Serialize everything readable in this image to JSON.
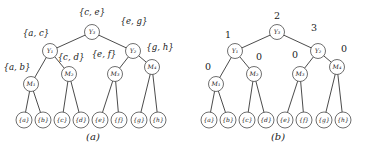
{
  "figure": {
    "panels": [
      {
        "id": "a",
        "caption": "(a)",
        "label_type": "sets",
        "nodes": [
          {
            "id": "Y3",
            "name": "Y₃",
            "x": 92,
            "y": 32,
            "r": 7.5,
            "label": "{c, e}",
            "label_x": 92,
            "label_y": 15,
            "label_anchor": "middle"
          },
          {
            "id": "Y1",
            "name": "Y₁",
            "x": 50,
            "y": 51,
            "r": 7.5,
            "label": "{a, c}",
            "label_x": 36,
            "label_y": 36,
            "label_anchor": "middle"
          },
          {
            "id": "Y2",
            "name": "Y₂",
            "x": 133,
            "y": 51,
            "r": 7.5,
            "label": "{e, g}",
            "label_x": 134,
            "label_y": 24,
            "label_anchor": "middle"
          },
          {
            "id": "M1",
            "name": "M₁",
            "x": 31,
            "y": 84,
            "r": 7.5,
            "label": "{a, b}",
            "label_x": 17,
            "label_y": 70,
            "label_anchor": "middle"
          },
          {
            "id": "M2",
            "name": "M₂",
            "x": 69,
            "y": 74,
            "r": 7.5,
            "label": "{c, d}",
            "label_x": 71,
            "label_y": 60,
            "label_anchor": "middle"
          },
          {
            "id": "M3",
            "name": "M₃",
            "x": 115,
            "y": 74,
            "r": 7.5,
            "label": "{e, f}",
            "label_x": 104,
            "label_y": 57,
            "label_anchor": "middle"
          },
          {
            "id": "M4",
            "name": "M₄",
            "x": 152,
            "y": 67,
            "r": 7.5,
            "label": "{g, h}",
            "label_x": 160,
            "label_y": 50,
            "label_anchor": "middle"
          }
        ],
        "leaves": [
          {
            "id": "a",
            "name": "{a}",
            "x": 24,
            "y": 120,
            "r": 8
          },
          {
            "id": "b",
            "name": "{b}",
            "x": 43,
            "y": 120,
            "r": 8
          },
          {
            "id": "c",
            "name": "{c}",
            "x": 62,
            "y": 120,
            "r": 8
          },
          {
            "id": "d",
            "name": "{d}",
            "x": 81,
            "y": 120,
            "r": 8
          },
          {
            "id": "e",
            "name": "{e}",
            "x": 100,
            "y": 120,
            "r": 8
          },
          {
            "id": "f",
            "name": "{f}",
            "x": 119,
            "y": 120,
            "r": 8
          },
          {
            "id": "g",
            "name": "{g}",
            "x": 139,
            "y": 120,
            "r": 8
          },
          {
            "id": "h",
            "name": "{h}",
            "x": 158,
            "y": 120,
            "r": 8
          }
        ],
        "edges": [
          {
            "from": "Y3",
            "to": "Y1"
          },
          {
            "from": "Y3",
            "to": "Y2"
          },
          {
            "from": "Y1",
            "to": "M1"
          },
          {
            "from": "Y1",
            "to": "M2"
          },
          {
            "from": "Y2",
            "to": "M3"
          },
          {
            "from": "Y2",
            "to": "M4"
          },
          {
            "from": "M1",
            "to": "a"
          },
          {
            "from": "M1",
            "to": "b"
          },
          {
            "from": "M2",
            "to": "c"
          },
          {
            "from": "M2",
            "to": "d"
          },
          {
            "from": "M3",
            "to": "e"
          },
          {
            "from": "M3",
            "to": "f"
          },
          {
            "from": "M4",
            "to": "g"
          },
          {
            "from": "M4",
            "to": "h"
          }
        ]
      },
      {
        "id": "b",
        "caption": "(b)",
        "label_type": "numbers",
        "nodes": [
          {
            "id": "Y3",
            "name": "Y₃",
            "x": 92,
            "y": 32,
            "r": 7.5,
            "label": "2",
            "label_x": 92,
            "label_y": 19,
            "label_anchor": "middle"
          },
          {
            "id": "Y1",
            "name": "Y₁",
            "x": 50,
            "y": 51,
            "r": 7.5,
            "label": "1",
            "label_x": 43,
            "label_y": 38,
            "label_anchor": "middle"
          },
          {
            "id": "Y2",
            "name": "Y₂",
            "x": 133,
            "y": 51,
            "r": 7.5,
            "label": "3",
            "label_x": 129,
            "label_y": 31,
            "label_anchor": "middle"
          },
          {
            "id": "M1",
            "name": "M₁",
            "x": 31,
            "y": 84,
            "r": 7.5,
            "label": "0",
            "label_x": 23,
            "label_y": 70,
            "label_anchor": "middle"
          },
          {
            "id": "M2",
            "name": "M₂",
            "x": 69,
            "y": 74,
            "r": 7.5,
            "label": "0",
            "label_x": 74,
            "label_y": 60,
            "label_anchor": "middle"
          },
          {
            "id": "M3",
            "name": "M₃",
            "x": 115,
            "y": 74,
            "r": 7.5,
            "label": "0",
            "label_x": 110,
            "label_y": 58,
            "label_anchor": "middle"
          },
          {
            "id": "M4",
            "name": "M₄",
            "x": 152,
            "y": 67,
            "r": 7.5,
            "label": "0",
            "label_x": 159,
            "label_y": 52,
            "label_anchor": "middle"
          }
        ],
        "leaves": [
          {
            "id": "a",
            "name": "{a}",
            "x": 24,
            "y": 120,
            "r": 8
          },
          {
            "id": "b",
            "name": "{b}",
            "x": 43,
            "y": 120,
            "r": 8
          },
          {
            "id": "c",
            "name": "{c}",
            "x": 62,
            "y": 120,
            "r": 8
          },
          {
            "id": "d",
            "name": "{d}",
            "x": 81,
            "y": 120,
            "r": 8
          },
          {
            "id": "e",
            "name": "{e}",
            "x": 100,
            "y": 120,
            "r": 8
          },
          {
            "id": "f",
            "name": "{f}",
            "x": 119,
            "y": 120,
            "r": 8
          },
          {
            "id": "g",
            "name": "{g}",
            "x": 139,
            "y": 120,
            "r": 8
          },
          {
            "id": "h",
            "name": "{h}",
            "x": 158,
            "y": 120,
            "r": 8
          }
        ],
        "edges": [
          {
            "from": "Y3",
            "to": "Y1"
          },
          {
            "from": "Y3",
            "to": "Y2"
          },
          {
            "from": "Y1",
            "to": "M1"
          },
          {
            "from": "Y1",
            "to": "M2"
          },
          {
            "from": "Y2",
            "to": "M3"
          },
          {
            "from": "Y2",
            "to": "M4"
          },
          {
            "from": "M1",
            "to": "a"
          },
          {
            "from": "M1",
            "to": "b"
          },
          {
            "from": "M2",
            "to": "c"
          },
          {
            "from": "M2",
            "to": "d"
          },
          {
            "from": "M3",
            "to": "e"
          },
          {
            "from": "M3",
            "to": "f"
          },
          {
            "from": "M4",
            "to": "g"
          },
          {
            "from": "M4",
            "to": "h"
          }
        ]
      }
    ],
    "colors": {
      "stroke": "#2b2b2b",
      "node_stroke": "#4a4a4a",
      "text": "#1a1a1a",
      "background": "#ffffff"
    }
  }
}
